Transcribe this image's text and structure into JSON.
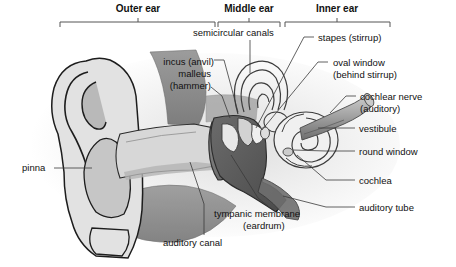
{
  "diagram": {
    "type": "labeled-anatomical-cross-section",
    "background_color": "#ffffff",
    "line_color": "#444444",
    "text_color": "#111111"
  },
  "regions": [
    {
      "id": "outer-ear",
      "label": "Outer ear",
      "bracket": {
        "x1": 60,
        "x2": 215,
        "tick": 138
      },
      "label_x": 138,
      "label_y": 3
    },
    {
      "id": "middle-ear",
      "label": "Middle ear",
      "bracket": {
        "x1": 218,
        "x2": 280,
        "tick": 249
      },
      "label_x": 249,
      "label_y": 3
    },
    {
      "id": "inner-ear",
      "label": "Inner ear",
      "bracket": {
        "x1": 285,
        "x2": 390,
        "tick": 337
      },
      "label_x": 337,
      "label_y": 3
    }
  ],
  "labels": [
    {
      "id": "semicircular-canals",
      "text": "semicircular canals",
      "x": 193,
      "y": 27,
      "align": "left",
      "leader": [
        [
          250,
          40
        ],
        [
          250,
          73
        ]
      ]
    },
    {
      "id": "stapes",
      "text": "stapes (stirrup)",
      "x": 318,
      "y": 32,
      "align": "left",
      "leader": [
        [
          314,
          37
        ],
        [
          304,
          37
        ],
        [
          256,
          128
        ]
      ]
    },
    {
      "id": "incus",
      "text": "incus (anvil)",
      "x": 155,
      "y": 56,
      "align": "left",
      "leader": [
        [
          214,
          60
        ],
        [
          224,
          60
        ],
        [
          238,
          112
        ]
      ]
    },
    {
      "id": "malleus",
      "text": "malleus",
      "x": 169,
      "y": 69,
      "align": "left",
      "leader": []
    },
    {
      "id": "malleus-hammer",
      "text": "(hammer)",
      "x": 163,
      "y": 81,
      "align": "left",
      "leader": [
        [
          211,
          87
        ],
        [
          222,
          96
        ],
        [
          230,
          118
        ]
      ]
    },
    {
      "id": "oval-window",
      "text": "oval window",
      "x": 333,
      "y": 57,
      "align": "left",
      "leader": [
        [
          328,
          62
        ],
        [
          318,
          62
        ],
        [
          258,
          131
        ]
      ]
    },
    {
      "id": "oval-window-sub",
      "text": "(behind stirrup)",
      "x": 333,
      "y": 69,
      "align": "left",
      "leader": []
    },
    {
      "id": "cochlear-nerve",
      "text": "cochlear nerve",
      "x": 360,
      "y": 91,
      "align": "left",
      "leader": [
        [
          356,
          96
        ],
        [
          346,
          96
        ],
        [
          330,
          113
        ]
      ]
    },
    {
      "id": "cochlear-nerve-sub",
      "text": "(auditory)",
      "x": 360,
      "y": 103,
      "align": "left",
      "leader": []
    },
    {
      "id": "vestibule",
      "text": "vestibule",
      "x": 359,
      "y": 124,
      "align": "left",
      "leader": [
        [
          355,
          128
        ],
        [
          318,
          128
        ]
      ]
    },
    {
      "id": "round-window",
      "text": "round window",
      "x": 359,
      "y": 147,
      "align": "left",
      "leader": [
        [
          355,
          151
        ],
        [
          326,
          151
        ],
        [
          300,
          141
        ]
      ]
    },
    {
      "id": "cochlea",
      "text": "cochlea",
      "x": 359,
      "y": 176,
      "align": "left",
      "leader": [
        [
          355,
          180
        ],
        [
          326,
          180
        ],
        [
          296,
          152
        ]
      ]
    },
    {
      "id": "auditory-tube",
      "text": "auditory tube",
      "x": 359,
      "y": 203,
      "align": "left",
      "leader": [
        [
          355,
          207
        ],
        [
          326,
          207
        ],
        [
          276,
          190
        ]
      ]
    },
    {
      "id": "pinna",
      "text": "pinna",
      "x": 22,
      "y": 163,
      "align": "left",
      "leader": [
        [
          54,
          168
        ],
        [
          84,
          168
        ]
      ]
    },
    {
      "id": "tympanic-membrane",
      "text": "tympanic membrane",
      "x": 214,
      "y": 209,
      "align": "left",
      "leader": [
        [
          268,
          206
        ],
        [
          256,
          196
        ],
        [
          243,
          150
        ]
      ]
    },
    {
      "id": "eardrum",
      "text": "(eardrum)",
      "x": 243,
      "y": 221,
      "align": "left",
      "leader": []
    },
    {
      "id": "auditory-canal",
      "text": "auditory canal",
      "x": 163,
      "y": 238,
      "align": "left",
      "leader": [
        [
          204,
          235
        ],
        [
          204,
          204
        ],
        [
          194,
          160
        ]
      ]
    }
  ],
  "anatomy_parts": [
    {
      "id": "pinna-shape",
      "name": "pinna",
      "fill": "#dcdcdc"
    },
    {
      "id": "ear-canal",
      "name": "auditory canal",
      "fill": "#cfcfcf"
    },
    {
      "id": "skull-bone",
      "name": "temporal bone",
      "fill": "#8d8d8d"
    },
    {
      "id": "ossicles",
      "name": "malleus incus stapes",
      "fill": "#5a5a5a"
    },
    {
      "id": "eardrum-shape",
      "name": "tympanic membrane",
      "fill": "#707070"
    },
    {
      "id": "cochlea-spiral",
      "name": "cochlea",
      "fill": "#efefef"
    },
    {
      "id": "semicircular-canal-shape",
      "name": "semicircular canals",
      "fill": "#efefef"
    },
    {
      "id": "nerve-tube",
      "name": "cochlear nerve",
      "fill": "#9a9a9a"
    },
    {
      "id": "eustachian-tube",
      "name": "auditory tube",
      "fill": "#9a9a9a"
    }
  ]
}
